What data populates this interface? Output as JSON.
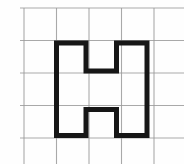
{
  "figure": {
    "width": 184,
    "height": 164,
    "background_color": "#fefefe",
    "grid": {
      "line_color": "#9b9b9b",
      "line_width": 1.1,
      "line_opacity": 0.85,
      "vertical_lines_x": [
        24,
        56.5,
        89,
        121.5,
        154
      ],
      "horizontal_lines_y": [
        8,
        40.5,
        73,
        105.5,
        138
      ],
      "vertical_line_y_span": [
        8,
        164
      ],
      "horizontal_line_x_span": [
        20,
        184
      ]
    },
    "shape": {
      "name": "letter-H-outline",
      "stroke_color": "#161616",
      "stroke_width": 5,
      "fill": "none",
      "points": [
        [
          56.5,
          43
        ],
        [
          86,
          43
        ],
        [
          86,
          71
        ],
        [
          116.5,
          71
        ],
        [
          116.5,
          43
        ],
        [
          147,
          43
        ],
        [
          147,
          135.5
        ],
        [
          116.5,
          135.5
        ],
        [
          116.5,
          109.5
        ],
        [
          86,
          109.5
        ],
        [
          86,
          135.5
        ],
        [
          56.5,
          135.5
        ]
      ]
    }
  }
}
